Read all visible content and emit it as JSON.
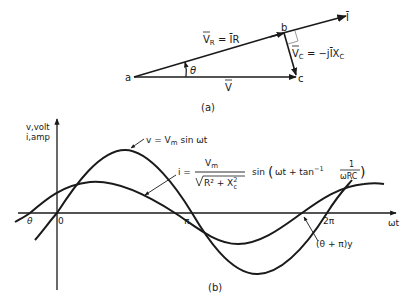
{
  "phasor_diagram": {
    "caption": "(a)",
    "points": {
      "a": "a",
      "b": "b",
      "c": "c"
    },
    "labels": {
      "current": "Ī",
      "vr_lhs": "V",
      "vr_sub": "R",
      "vr_rhs": " = ĪR",
      "vc_lhs": "V",
      "vc_sub": "C",
      "vc_rhs": " = −jĪX",
      "vc_rhs_sub": "C",
      "v": "V",
      "theta": "θ"
    }
  },
  "waveform": {
    "caption": "(b)",
    "y_axis_label_1": "v,volt",
    "y_axis_label_2": "i,amp",
    "x_axis_label": "ωt",
    "tick_theta": "θ",
    "tick_zero": "0",
    "tick_pi": "π",
    "tick_2pi": "2π",
    "v_eq_lhs": "v = V",
    "v_eq_sub": "m",
    "v_eq_rhs": " sin ωt",
    "i_eq_lhs": "i =",
    "i_eq_num": "V",
    "i_eq_num_sub": "m",
    "i_eq_den": "R² + X",
    "i_eq_den_sub": "c",
    "i_eq_den_sup": "2",
    "i_eq_sin": "sin",
    "i_eq_arg": "ωt + tan",
    "i_eq_arg_sup": "−1",
    "i_eq_frac_num": "1",
    "i_eq_frac_den": "ωRC",
    "annot_phase": "(θ + π)y"
  }
}
